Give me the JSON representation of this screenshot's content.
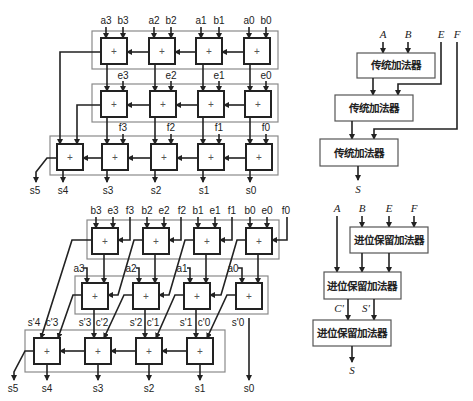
{
  "top_left_ripple": {
    "row1_inputs": [
      "a3",
      "b3",
      "a2",
      "b2",
      "a1",
      "b1",
      "a0",
      "b0"
    ],
    "row2_inputs": [
      "e3",
      "e2",
      "e1",
      "e0"
    ],
    "row3_inputs": [
      "f3",
      "f2",
      "f1",
      "f0"
    ],
    "outputs": [
      "s5",
      "s4",
      "s3",
      "s2",
      "s1",
      "s0"
    ],
    "cell_symbol": "+"
  },
  "top_right_block": {
    "inputs": [
      "A",
      "B",
      "E",
      "F"
    ],
    "blocks": [
      "传统加法器",
      "传统加法器",
      "传统加法器"
    ],
    "output": "S"
  },
  "bottom_left_csa": {
    "row1_inputs": [
      "b3",
      "e3",
      "f3",
      "b2",
      "e2",
      "f2",
      "b1",
      "e1",
      "f1",
      "b0",
      "e0",
      "f0"
    ],
    "row2_inputs": [
      "a3",
      "a2",
      "a1",
      "a0"
    ],
    "intermediate": [
      "s'4",
      "c'3",
      "s'3",
      "c'2",
      "s'2",
      "c'1",
      "s'1",
      "c'0",
      "s'0"
    ],
    "outputs": [
      "s5",
      "s4",
      "s3",
      "s2",
      "s1",
      "s0"
    ],
    "cell_symbol": "+"
  },
  "bottom_right_block": {
    "inputs": [
      "A",
      "B",
      "E",
      "F"
    ],
    "blocks": [
      "进位保留加法器",
      "进位保留加法器",
      "进位保留加法器"
    ],
    "intermediate": [
      "C'",
      "S'"
    ],
    "output": "S"
  }
}
